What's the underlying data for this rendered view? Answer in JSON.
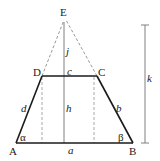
{
  "diagram": {
    "colors": {
      "solid_line": "#1a1a1a",
      "helper_line": "#808080",
      "dashed_line": "#9a9a9a",
      "text": "#222222"
    },
    "vertices": {
      "A": {
        "label": "A",
        "x": 16,
        "y": 143
      },
      "B": {
        "label": "B",
        "x": 133,
        "y": 143
      },
      "C": {
        "label": "C",
        "x": 97,
        "y": 76
      },
      "D": {
        "label": "D",
        "x": 42,
        "y": 76
      },
      "E": {
        "label": "E",
        "x": 64,
        "y": 18
      }
    },
    "sides": {
      "a": "a",
      "b": "b",
      "c": "c",
      "d": "d"
    },
    "heights": {
      "h": "h",
      "j": "j",
      "k": "k"
    },
    "angles": {
      "alpha": "α",
      "beta": "β"
    }
  }
}
